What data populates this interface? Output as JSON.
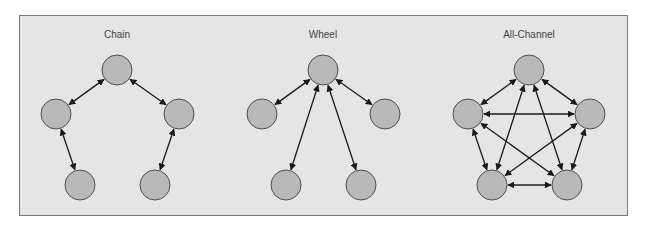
{
  "diagram": {
    "colors": {
      "background": "#e5e5e5",
      "border": "#7a7a7a",
      "node_fill": "#b9b9b9",
      "node_stroke": "#4e4e4e",
      "edge": "#1a1a1a",
      "title": "#444444"
    },
    "node_radius": 15,
    "networks": [
      {
        "id": "chain",
        "title": "Chain",
        "title_pos": [
          117,
          38
        ],
        "nodes": [
          {
            "id": "top",
            "x": 117,
            "y": 70
          },
          {
            "id": "left",
            "x": 56,
            "y": 114
          },
          {
            "id": "right",
            "x": 179,
            "y": 114
          },
          {
            "id": "bottom-left",
            "x": 80,
            "y": 185
          },
          {
            "id": "bottom-right",
            "x": 155,
            "y": 185
          }
        ],
        "edges": [
          [
            "top",
            "left"
          ],
          [
            "top",
            "right"
          ],
          [
            "left",
            "bottom-left"
          ],
          [
            "right",
            "bottom-right"
          ]
        ]
      },
      {
        "id": "wheel",
        "title": "Wheel",
        "title_pos": [
          323,
          38
        ],
        "nodes": [
          {
            "id": "hub",
            "x": 323,
            "y": 70
          },
          {
            "id": "left",
            "x": 262,
            "y": 114
          },
          {
            "id": "right",
            "x": 385,
            "y": 114
          },
          {
            "id": "bottom-left",
            "x": 286,
            "y": 185
          },
          {
            "id": "bottom-right",
            "x": 361,
            "y": 185
          }
        ],
        "edges": [
          [
            "hub",
            "left"
          ],
          [
            "hub",
            "right"
          ],
          [
            "hub",
            "bottom-left"
          ],
          [
            "hub",
            "bottom-right"
          ]
        ]
      },
      {
        "id": "all-channel",
        "title": "All-Channel",
        "title_pos": [
          529,
          38
        ],
        "nodes": [
          {
            "id": "top",
            "x": 529,
            "y": 70
          },
          {
            "id": "left",
            "x": 468,
            "y": 114
          },
          {
            "id": "right",
            "x": 590,
            "y": 114
          },
          {
            "id": "bottom-left",
            "x": 492,
            "y": 185
          },
          {
            "id": "bottom-right",
            "x": 567,
            "y": 185
          }
        ],
        "edges": [
          [
            "top",
            "left"
          ],
          [
            "top",
            "right"
          ],
          [
            "top",
            "bottom-left"
          ],
          [
            "top",
            "bottom-right"
          ],
          [
            "left",
            "right"
          ],
          [
            "left",
            "bottom-left"
          ],
          [
            "left",
            "bottom-right"
          ],
          [
            "right",
            "bottom-left"
          ],
          [
            "right",
            "bottom-right"
          ],
          [
            "bottom-left",
            "bottom-right"
          ]
        ]
      }
    ]
  }
}
